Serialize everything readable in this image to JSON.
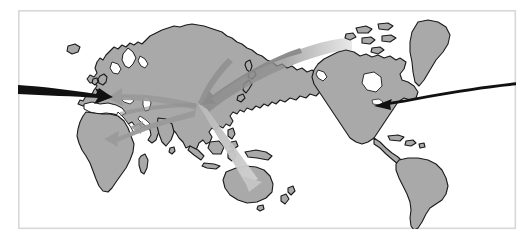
{
  "figure": {
    "type": "map-diagram",
    "width": 532,
    "height": 239,
    "background_color": "#ffffff"
  },
  "frame": {
    "name": "map-border-frame",
    "x": 18,
    "y": 10,
    "width": 498,
    "height": 219,
    "stroke_color": "#d8d8d8",
    "stroke_width": 1.6,
    "fill_color": "#ffffff"
  },
  "style": {
    "land_fill": "#a9a9a9",
    "land_stroke": "#1a1a1a",
    "land_stroke_width": 1.1,
    "arrow_black": "#111111",
    "arrow_dark_gray": "#8f8f8f",
    "arrow_mid_gray": "#9c9c9c",
    "arrow_light_gray": "#c9c9c9",
    "ocean_fill": "#ffffff"
  },
  "projection": {
    "centered_on": "Pacific",
    "description": "Asia-centric world map, Americas at right, Europe and Africa at left"
  },
  "landmasses": [
    {
      "name": "eurasia",
      "label": "Eurasia"
    },
    {
      "name": "africa",
      "label": "Africa"
    },
    {
      "name": "north-america",
      "label": "North America"
    },
    {
      "name": "south-america",
      "label": "South America"
    },
    {
      "name": "greenland",
      "label": "Greenland"
    },
    {
      "name": "australia",
      "label": "Australia"
    },
    {
      "name": "new-zealand",
      "label": "New Zealand"
    },
    {
      "name": "japan",
      "label": "Japan"
    },
    {
      "name": "iceland",
      "label": "Iceland"
    },
    {
      "name": "british-isles",
      "label": "British Isles"
    },
    {
      "name": "madagascar",
      "label": "Madagascar"
    },
    {
      "name": "indonesia",
      "label": "Indonesia"
    },
    {
      "name": "philippines",
      "label": "Philippines"
    },
    {
      "name": "caribbean",
      "label": "Caribbean Islands"
    },
    {
      "name": "arctic-islands",
      "label": "Canadian Arctic Archipelago"
    }
  ],
  "hub": {
    "name": "flow-hub",
    "x": 196,
    "y": 107,
    "region_label": "East Asia"
  },
  "flow_arrows": [
    {
      "id": "arrow-inbound-europe",
      "name": "black-arrow-to-europe",
      "color_key": "arrow_black",
      "from": {
        "x": 0,
        "y": 88
      },
      "to": {
        "x": 108,
        "y": 99
      },
      "direction": "inbound",
      "weight": "heavy"
    },
    {
      "id": "arrow-inbound-north-america",
      "name": "black-arrow-to-north-america",
      "color_key": "arrow_black",
      "from": {
        "x": 532,
        "y": 87
      },
      "to": {
        "x": 376,
        "y": 104
      },
      "direction": "inbound",
      "weight": "heavy"
    },
    {
      "id": "arrow-hub-to-north-pacific",
      "name": "gray-arrow-hub-to-alaska",
      "color_key": "arrow_dark_gray",
      "from": {
        "x": 345,
        "y": 42
      },
      "to": {
        "x": 200,
        "y": 103
      },
      "direction": "toward-hub",
      "weight": "wide"
    },
    {
      "id": "arrow-hub-to-europe",
      "name": "gray-arrow-hub-to-europe",
      "color_key": "arrow_mid_gray",
      "from": {
        "x": 196,
        "y": 106
      },
      "to": {
        "x": 108,
        "y": 100
      },
      "direction": "from-hub",
      "weight": "medium"
    },
    {
      "id": "arrow-hub-to-africa",
      "name": "gray-arrow-hub-to-africa",
      "color_key": "arrow_mid_gray",
      "from": {
        "x": 196,
        "y": 109
      },
      "to": {
        "x": 108,
        "y": 136
      },
      "direction": "from-hub",
      "weight": "medium"
    },
    {
      "id": "arrow-hub-to-india",
      "name": "gray-arrow-hub-to-south-asia",
      "color_key": "arrow_mid_gray",
      "from": {
        "x": 196,
        "y": 110
      },
      "to": {
        "x": 128,
        "y": 122
      },
      "direction": "from-hub",
      "weight": "medium"
    },
    {
      "id": "arrow-hub-to-australia",
      "name": "light-arrow-hub-to-australia",
      "color_key": "arrow_light_gray",
      "from": {
        "x": 200,
        "y": 108
      },
      "to": {
        "x": 252,
        "y": 178
      },
      "direction": "from-hub",
      "weight": "medium"
    },
    {
      "id": "arrow-siberia-inbound",
      "name": "gray-arrowhead-into-hub-northeast",
      "color_key": "arrow_mid_gray",
      "from": {
        "x": 250,
        "y": 70
      },
      "to": {
        "x": 202,
        "y": 100
      },
      "direction": "toward-hub",
      "weight": "thin"
    }
  ]
}
